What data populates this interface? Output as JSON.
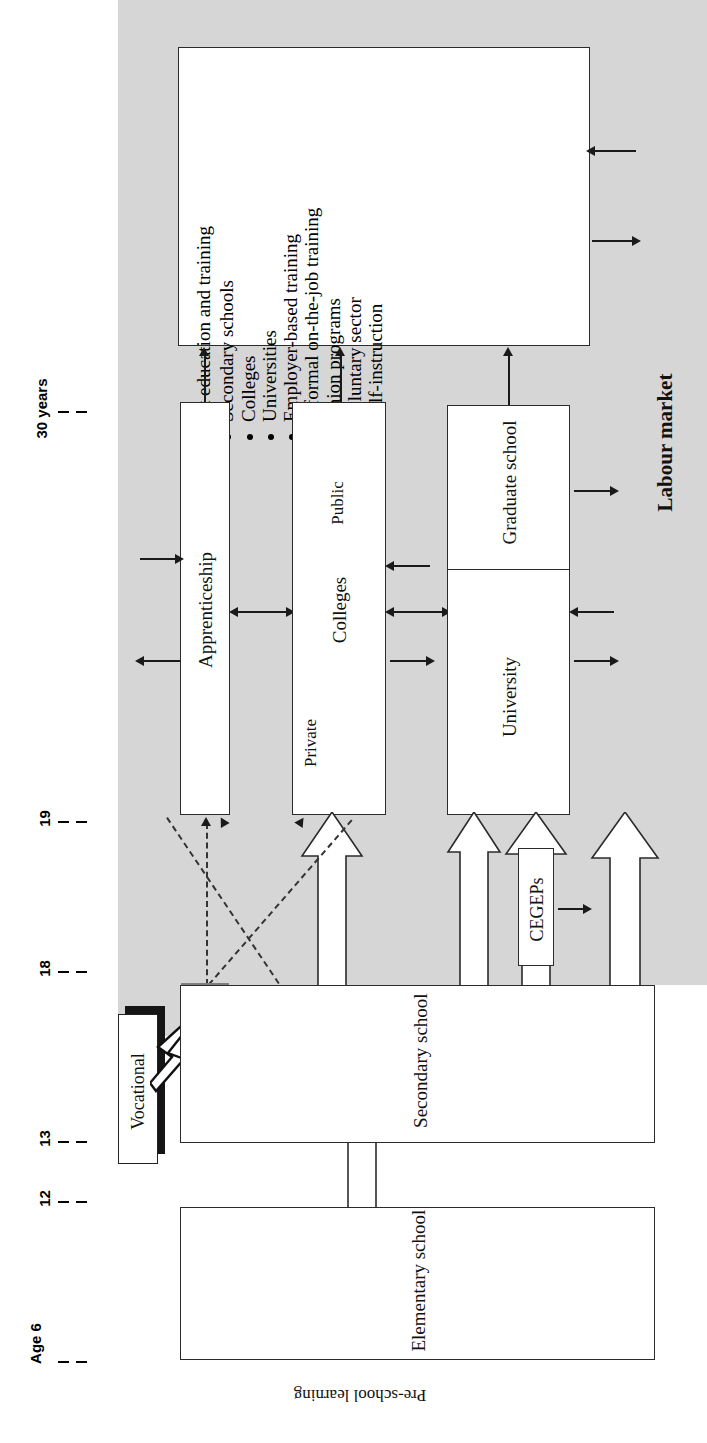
{
  "diagram": {
    "axis": {
      "name": "Age axis",
      "ticks": [
        {
          "label": "30 years",
          "value": 30
        },
        {
          "label": "19",
          "value": 19
        },
        {
          "label": "18",
          "value": 18
        },
        {
          "label": "13",
          "value": 13
        },
        {
          "label": "12",
          "value": 12
        },
        {
          "label": "Age 6",
          "value": 6
        }
      ]
    },
    "region_label": "Labour market",
    "preschool_label": "Pre-school learning",
    "adult_box": {
      "heading": "Adult education and training",
      "bullets": [
        "Secondary schools",
        "Colleges",
        "Universities",
        "Employer-based training",
        "Informal on-the-job training",
        "Union programs",
        "Voluntary sector",
        "Self-instruction"
      ]
    },
    "nodes": {
      "apprenticeship": "Apprenticeship",
      "colleges": "Colleges",
      "colleges_private": "Private",
      "colleges_public": "Public",
      "university": "University",
      "graduate_school": "Graduate school",
      "cegeps": "CEGEPs",
      "secondary_school": "Secondary school",
      "elementary_school": "Elementary school",
      "vocational": "Vocational"
    },
    "colors": {
      "labour_market_fill": "#d6d6d6",
      "box_stroke": "#2b2b2b",
      "vocational_target": "#7d7d7d",
      "page_background": "#ffffff"
    }
  }
}
